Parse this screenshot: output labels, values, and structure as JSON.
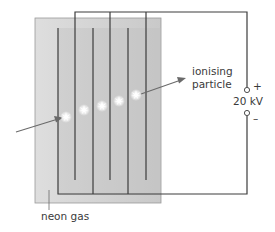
{
  "diagram": {
    "labels": {
      "ionising_particle_line1": "ionising",
      "ionising_particle_line2": "particle",
      "voltage": "20 kV",
      "plus": "+",
      "minus": "–",
      "neon_gas": "neon gas"
    },
    "colors": {
      "gas_outer": "#d4d4d4",
      "gas_inner": "#bdbdbd",
      "wire": "#3c3c3c",
      "arrow": "#6a6a6a",
      "spark": "#ffffff"
    },
    "spark_count": 5
  }
}
